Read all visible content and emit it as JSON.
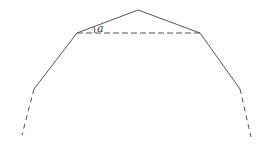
{
  "diagram": {
    "angle_label": "a",
    "stroke_color": "#555555",
    "solid_segments": [
      {
        "from": [
          34,
          89
        ],
        "to": [
          77,
          33
        ]
      },
      {
        "from": [
          77,
          33
        ],
        "to": [
          138,
          10
        ]
      },
      {
        "from": [
          138,
          10
        ],
        "to": [
          200,
          33
        ]
      },
      {
        "from": [
          200,
          33
        ],
        "to": [
          240,
          89
        ]
      }
    ],
    "dashed_segments": [
      {
        "from": [
          77,
          33
        ],
        "to": [
          200,
          33
        ]
      },
      {
        "from": [
          34,
          89
        ],
        "to": [
          22,
          135
        ]
      },
      {
        "from": [
          240,
          89
        ],
        "to": [
          251,
          137
        ]
      }
    ]
  }
}
